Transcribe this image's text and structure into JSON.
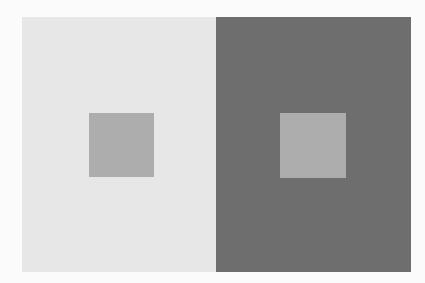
{
  "figure": {
    "title": ""
  },
  "colors": {
    "page_background": "#fbfbfb",
    "left_background": "#e7e7e7",
    "right_background": "#6e6e6e",
    "left_square": "#adadad",
    "right_square": "#adadad"
  },
  "panels": [
    {
      "name": "light-panel",
      "x": 22,
      "y": 17,
      "width": 194,
      "height": 255,
      "background": "#e7e7e7",
      "square": {
        "x": 89,
        "y": 113,
        "width": 65,
        "height": 64,
        "color": "#adadad"
      }
    },
    {
      "name": "dark-panel",
      "x": 216,
      "y": 17,
      "width": 195,
      "height": 255,
      "background": "#6e6e6e",
      "square": {
        "x": 280,
        "y": 113,
        "width": 66,
        "height": 65,
        "color": "#adadad"
      }
    }
  ]
}
